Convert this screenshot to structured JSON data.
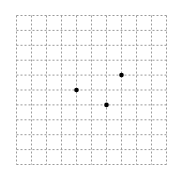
{
  "grid": {
    "columns": 10,
    "rows": 10,
    "origin_x": 16.5,
    "origin_y": 15.5,
    "cell_width": 15,
    "cell_height": 14.9,
    "line_color": "#9a9a9a",
    "dash": "2,2"
  },
  "points": [
    {
      "col": 4,
      "row": 5,
      "color": "#000000"
    },
    {
      "col": 6,
      "row": 6,
      "color": "#000000"
    },
    {
      "col": 7,
      "row": 4,
      "color": "#000000"
    }
  ]
}
